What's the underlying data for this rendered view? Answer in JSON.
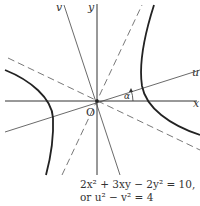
{
  "figure": {
    "type": "rotated-hyperbola",
    "labels": {
      "x_axis": "x",
      "y_axis": "y",
      "u_axis": "u",
      "v_axis": "v",
      "origin": "O",
      "angle": "α"
    },
    "equation_line1": "2x² + 3xy − 2y² = 10,",
    "equation_line2": "or u² − v² = 4"
  }
}
